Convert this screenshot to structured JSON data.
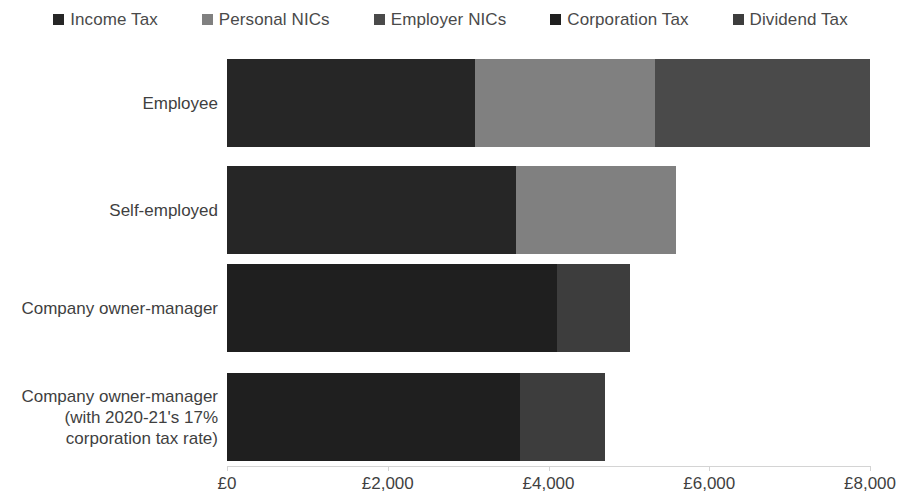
{
  "chart_data": {
    "type": "bar",
    "orientation": "horizontal",
    "stacked": true,
    "title": "",
    "subtitle": "",
    "xlabel": "",
    "ylabel": "",
    "xlim": [
      0,
      8000
    ],
    "grid": false,
    "legend_position": "top",
    "currency": "GBP",
    "categories": [
      "Employee",
      "Self-employed",
      "Company owner-manager",
      "Company owner-manager (with 2020-21's 17% corporation tax rate)"
    ],
    "category_lines": [
      [
        "Employee"
      ],
      [
        "Self-employed"
      ],
      [
        "Company owner-manager"
      ],
      [
        "Company owner-manager",
        "(with 2020-21's 17%",
        "corporation tax rate)"
      ]
    ],
    "series": [
      {
        "name": "Income Tax",
        "color": "#262626",
        "values": [
          3085,
          3595,
          0,
          0
        ]
      },
      {
        "name": "Personal NICs",
        "color": "#808080",
        "values": [
          2239,
          1990,
          0,
          0
        ]
      },
      {
        "name": "Employer NICs",
        "color": "#4a4a4a",
        "values": [
          2674,
          0,
          0,
          0
        ]
      },
      {
        "name": "Corporation Tax",
        "color": "#1f1f1f",
        "values": [
          0,
          0,
          4104,
          3645
        ]
      },
      {
        "name": "Dividend Tax",
        "color": "#3d3d3d",
        "values": [
          0,
          0,
          908,
          1057
        ]
      }
    ],
    "totals": [
      7998,
      5585,
      5012,
      4702
    ],
    "xticks": [
      0,
      2000,
      4000,
      6000,
      8000
    ],
    "xtick_labels": [
      "£0",
      "£2,000",
      "£4,000",
      "£6,000",
      "£8,000"
    ]
  },
  "legend": {
    "items": [
      {
        "label": "Income Tax",
        "color": "#262626"
      },
      {
        "label": "Personal NICs",
        "color": "#808080"
      },
      {
        "label": "Employer NICs",
        "color": "#4a4a4a"
      },
      {
        "label": "Corporation Tax",
        "color": "#1f1f1f"
      },
      {
        "label": "Dividend Tax",
        "color": "#3d3d3d"
      }
    ]
  }
}
